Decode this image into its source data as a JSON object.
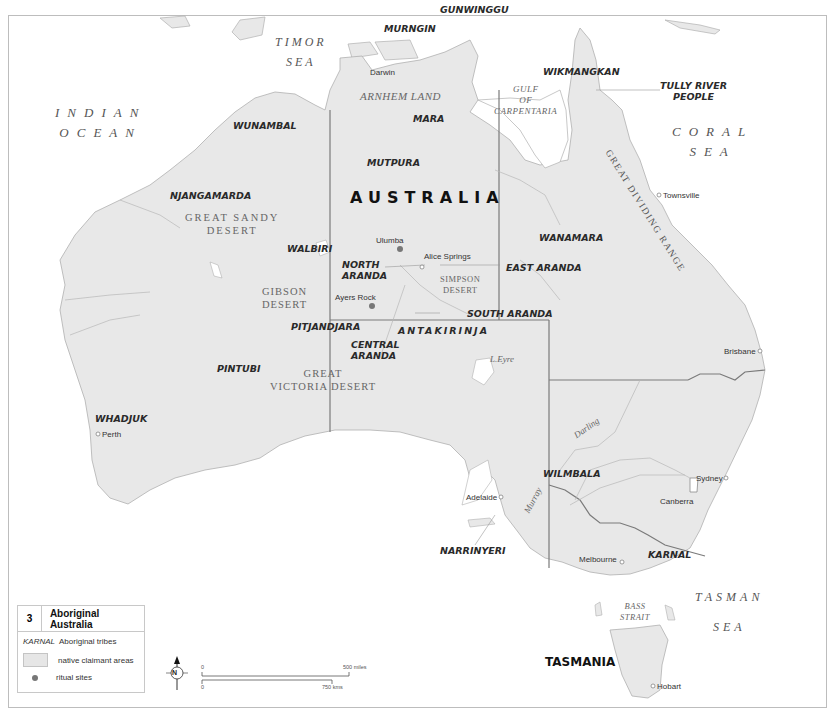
{
  "map": {
    "title_number": "3",
    "title": "Aboriginal Australia",
    "country_label": "AUSTRALIA",
    "state_label": "TASMANIA",
    "colors": {
      "land": "#e8e8e8",
      "sea": "#ffffff",
      "border": "#7a7a7a",
      "coast": "#b0b0b0",
      "ritual_site": "#777777"
    },
    "seas": [
      {
        "name_line1": "INDIAN",
        "name_line2": "OCEAN"
      },
      {
        "name_line1": "TIMOR",
        "name_line2": "SEA"
      },
      {
        "name_line1": "CORAL",
        "name_line2": "SEA"
      },
      {
        "name_line1": "TASMAN",
        "name_line2": "SEA"
      },
      {
        "name_line1": "GULF",
        "name_line2": "OF",
        "name_line3": "CARPENTARIA"
      },
      {
        "name_line1": "BASS",
        "name_line2": "STRAIT"
      }
    ],
    "regions": [
      {
        "name_line1": "ARNHEM LAND"
      },
      {
        "name_line1": "GREAT SANDY",
        "name_line2": "DESERT"
      },
      {
        "name_line1": "GIBSON",
        "name_line2": "DESERT"
      },
      {
        "name_line1": "SIMPSON",
        "name_line2": "DESERT"
      },
      {
        "name_line1": "GREAT",
        "name_line2": "VICTORIA DESERT"
      },
      {
        "name_line1": "GREAT DIVIDING RANGE"
      }
    ],
    "tribes": [
      "MURNGIN",
      "GUNWINGGU",
      "WIKMANGKAN",
      "TULLY RIVER",
      "PEOPLE",
      "MARA",
      "WUNAMBAL",
      "MUTPURA",
      "NJANGAMARDA",
      "WALBIRI",
      "NORTH",
      "ARANDA",
      "EAST ARANDA",
      "WANAMARA",
      "SOUTH ARANDA",
      "ANTAKIRINJA",
      "PITJANDJARA",
      "CENTRAL",
      "ARANDA",
      "PINTUBI",
      "WHADJUK",
      "WILMBALA",
      "NARRINYERI",
      "KARNAL"
    ],
    "cities": [
      "Darwin",
      "Townsville",
      "Alice Springs",
      "Brisbane",
      "Perth",
      "Adelaide",
      "Sydney",
      "Canberra",
      "Melbourne",
      "Hobart"
    ],
    "ritual_sites": [
      "Ulumba",
      "Ayers Rock"
    ],
    "lakes": [
      "L.Eyre"
    ],
    "rivers": [
      "Darling",
      "Murray"
    ]
  },
  "legend": {
    "tribe_sample": "KARNAL",
    "tribe_desc": "Aboriginal tribes",
    "claimant_desc": "native claimant areas",
    "ritual_desc": "ritual sites"
  },
  "scale": {
    "miles_start": "0",
    "miles_end": "500 miles",
    "kms_start": "0",
    "kms_end": "750 kms",
    "north": "N"
  }
}
